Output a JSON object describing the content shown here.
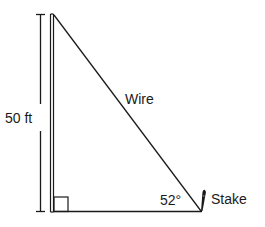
{
  "diagram": {
    "type": "right-triangle",
    "labels": {
      "height": "50 ft",
      "hypotenuse": "Wire",
      "angle": "52°",
      "stake": "Stake"
    },
    "values": {
      "height_ft": 50,
      "angle_deg": 52
    },
    "elements": {
      "pole": "vertical pole",
      "wire": "diagonal wire from top of pole to stake",
      "ground": "horizontal ground line",
      "right_angle_marker": "square at base of pole"
    },
    "colors": {
      "line": "#1a1a1a",
      "background": "#ffffff"
    }
  }
}
